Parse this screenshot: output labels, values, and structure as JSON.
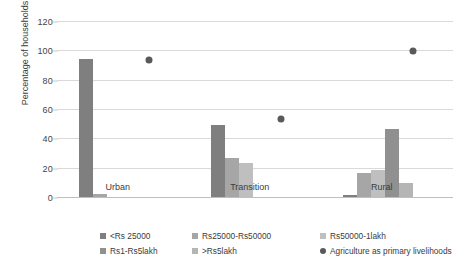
{
  "chart_data": {
    "type": "bar",
    "title": "",
    "xlabel": "",
    "ylabel": "Percentage of households",
    "categories": [
      "Urban",
      "Transition",
      "Rural"
    ],
    "ylim": [
      0,
      120
    ],
    "yticks": [
      0,
      20,
      40,
      60,
      80,
      100,
      120
    ],
    "grid": true,
    "legend_position": "bottom",
    "series": [
      {
        "name": "<Rs 25000",
        "type": "bar",
        "color": "#7f7f7f",
        "values": [
          95,
          50,
          2
        ]
      },
      {
        "name": "Rs25000-Rs50000",
        "type": "bar",
        "color": "#a6a6a6",
        "values": [
          3,
          27,
          17
        ]
      },
      {
        "name": "Rs50000-1lakh",
        "type": "bar",
        "color": "#bfbfbf",
        "values": [
          1,
          24,
          19
        ]
      },
      {
        "name": "Rs1-Rs5lakh",
        "type": "bar",
        "color": "#909090",
        "values": [
          0,
          0,
          47
        ]
      },
      {
        "name": ">Rs5lakh",
        "type": "bar",
        "color": "#b5b5b5",
        "values": [
          0,
          0,
          10
        ]
      },
      {
        "name": "Agriculture as primary livelihoods",
        "type": "scatter",
        "color": "#595959",
        "values": [
          94,
          54,
          100
        ]
      }
    ]
  },
  "axis": {
    "y_title": "Percentage of households",
    "y_tick_labels": [
      "120",
      "100",
      "80",
      "60",
      "40",
      "20",
      "0"
    ]
  },
  "legend": {
    "row1": [
      {
        "label": "<Rs 25000",
        "color": "#7f7f7f",
        "marker": "square"
      },
      {
        "label": "Rs25000-Rs50000",
        "color": "#a6a6a6",
        "marker": "square"
      },
      {
        "label": "Rs50000-1lakh",
        "color": "#bfbfbf",
        "marker": "square"
      }
    ],
    "row2": [
      {
        "label": "Rs1-Rs5lakh",
        "color": "#909090",
        "marker": "square"
      },
      {
        "label": ">Rs5lakh",
        "color": "#b5b5b5",
        "marker": "square"
      },
      {
        "label": "Agriculture as primary livelihoods",
        "color": "#595959",
        "marker": "circle"
      }
    ]
  },
  "colors": {
    "grid": "#d9d9d9",
    "text": "#3b3b3b",
    "background": "#ffffff"
  }
}
